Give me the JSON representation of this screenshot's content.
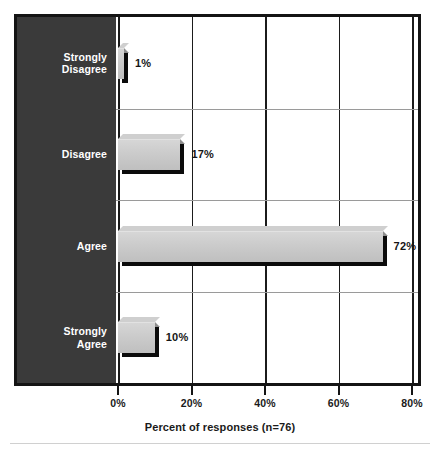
{
  "chart_data": {
    "type": "bar",
    "orientation": "horizontal",
    "title": "",
    "subtitle": "",
    "xlabel": "Percent of responses (n=76)",
    "ylabel": "",
    "categories": [
      "Strongly\nDisagree",
      "Disagree",
      "Agree",
      "Strongly\nAgree"
    ],
    "values": [
      1,
      17,
      72,
      10
    ],
    "value_labels": [
      "1%",
      "17%",
      "72%",
      "10%"
    ],
    "xlim": [
      0,
      80
    ],
    "xticks": [
      0,
      20,
      40,
      60,
      80
    ],
    "xtick_labels": [
      "0%",
      "20%",
      "40%",
      "60%",
      "80%"
    ],
    "grid": {
      "vertical": true,
      "horizontal": true
    },
    "legend": null,
    "annotations": [],
    "colors": {
      "bar_fill": "#cbcbcb",
      "bar_shadow": "#0b0b0b",
      "category_panel": "#3a3a3a",
      "category_text": "#ffffff",
      "frame": "#141414",
      "vgrid": "#1b1b1b",
      "hgrid": "#9a9a9a",
      "value_text": "#161616",
      "axis_text": "#1a1a1a",
      "background": "#ffffff",
      "footer_rule": "#d0d0d0"
    }
  }
}
